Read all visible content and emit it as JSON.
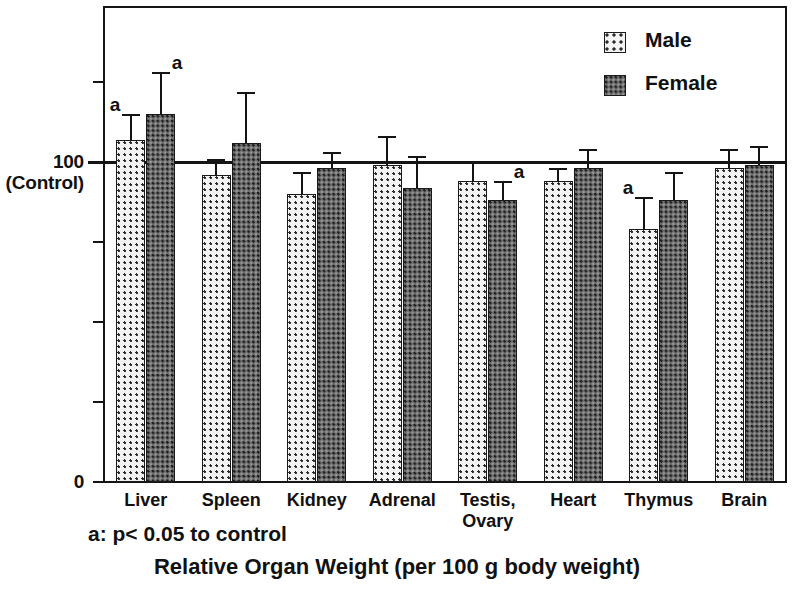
{
  "chart_data": {
    "type": "bar",
    "title": "Relative Organ Weight (per 100 g body weight)",
    "xlabel": "",
    "ylabel": "",
    "categories": [
      "Liver",
      "Spleen",
      "Kidney",
      "Adrenal",
      "Testis,\nOvary",
      "Heart",
      "Thymus",
      "Brain"
    ],
    "category_labels": [
      {
        "line1": "Liver",
        "line2": ""
      },
      {
        "line1": "Spleen",
        "line2": ""
      },
      {
        "line1": "Kidney",
        "line2": ""
      },
      {
        "line1": "Adrenal",
        "line2": ""
      },
      {
        "line1": "Testis,",
        "line2": "Ovary"
      },
      {
        "line1": "Heart",
        "line2": ""
      },
      {
        "line1": "Thymus",
        "line2": ""
      },
      {
        "line1": "Brain",
        "line2": ""
      }
    ],
    "series": [
      {
        "name": "Male",
        "color": "#f2f2f2",
        "pattern": "light-dotted",
        "values": [
          107,
          96,
          90,
          99,
          94,
          94,
          79,
          98
        ],
        "errors": [
          8,
          5,
          7,
          9,
          6,
          4,
          10,
          6
        ],
        "significant": [
          true,
          false,
          false,
          false,
          false,
          false,
          true,
          false
        ]
      },
      {
        "name": "Female",
        "color": "#6d6d6d",
        "pattern": "dark-dotted",
        "values": [
          115,
          106,
          98,
          92,
          88,
          98,
          88,
          99
        ],
        "errors": [
          13,
          16,
          5,
          10,
          6,
          6,
          9,
          6
        ],
        "significant": [
          true,
          false,
          false,
          false,
          true,
          false,
          false,
          false
        ]
      }
    ],
    "y_axis": {
      "reference_value": 100,
      "reference_label_line1": "100",
      "reference_label_line2": "(Control)",
      "zero_label": "0",
      "ticks": [
        0,
        25,
        50,
        75,
        100,
        125
      ],
      "ylim": [
        0,
        148
      ],
      "grid": false
    },
    "legend": {
      "position": "top-right",
      "entries": [
        "Male",
        "Female"
      ]
    },
    "footnote": "a: p< 0.05 to control",
    "significance_symbol": "a"
  },
  "legend": {
    "male_label": "Male",
    "female_label": "Female"
  },
  "axis": {
    "y_top_label": "100",
    "y_top_sub_label": "(Control)",
    "y_zero_label": "0"
  },
  "labels": {
    "footnote": "a: p< 0.05 to control",
    "axis_title": "Relative Organ Weight (per 100 g body weight)"
  }
}
